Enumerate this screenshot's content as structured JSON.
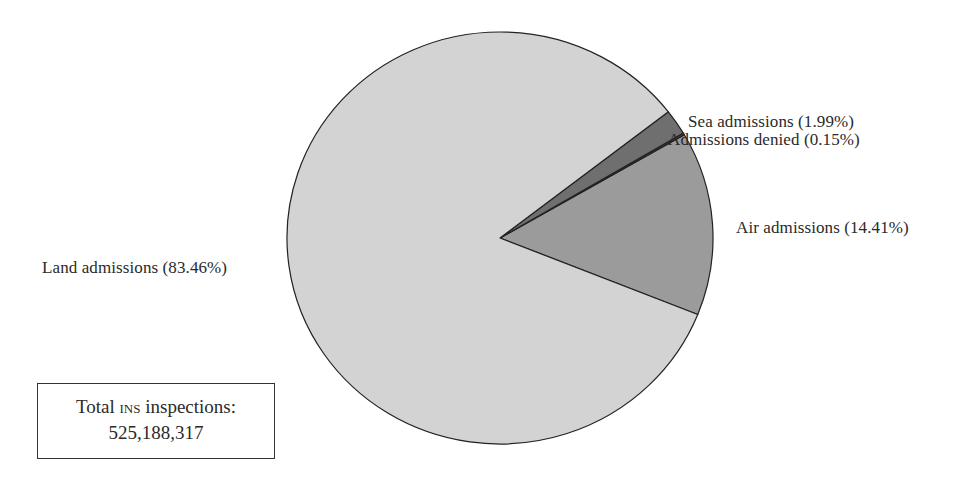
{
  "chart_data": {
    "type": "pie",
    "title": "",
    "categories": [
      "Land admissions",
      "Air admissions",
      "Admissions denied",
      "Sea admissions"
    ],
    "values": [
      83.46,
      14.41,
      0.15,
      1.99
    ],
    "unit": "%",
    "colors": [
      "#d3d3d3",
      "#9b9b9b",
      "#3a3a3a",
      "#6f6f6f"
    ],
    "labels": [
      "Land admissions (83.46%)",
      "Air admissions (14.41%)",
      "Admissions denied (0.15%)",
      "Sea admissions (1.99%)"
    ],
    "annotation": {
      "line1_pre": "Total ",
      "line1_sc": "INS",
      "line1_post": " inspections:",
      "line2": "525,188,317"
    }
  }
}
